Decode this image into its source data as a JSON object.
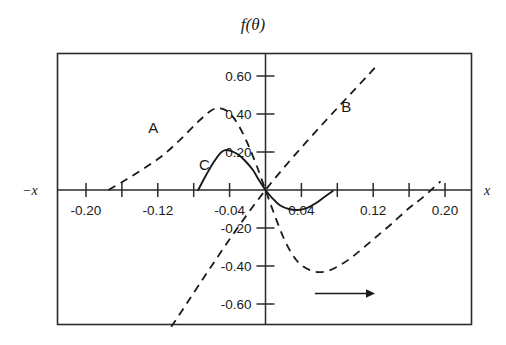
{
  "chart_data": {
    "type": "line",
    "title": "f(θ)",
    "xlabel_right": "x",
    "xlabel_left": "−x",
    "ylabel": "f(θ)",
    "grid": false,
    "legend_position": "inline-annotations",
    "xlim": [
      -0.24,
      0.24
    ],
    "ylim": [
      -0.78,
      0.78
    ],
    "xticks": [
      -0.2,
      -0.16,
      -0.12,
      -0.08,
      -0.04,
      0.04,
      0.08,
      0.12,
      0.16,
      0.2
    ],
    "xtick_labels": [
      "-0.20",
      "-0.12",
      "-0.04",
      "0.04",
      "0.12",
      "0.20"
    ],
    "xtick_labeled_values": [
      -0.2,
      -0.12,
      -0.04,
      0.04,
      0.12,
      0.2
    ],
    "yticks": [
      0.6,
      0.4,
      0.2,
      -0.2,
      -0.4,
      -0.6
    ],
    "ytick_labels": [
      "0.60",
      "0.40",
      "0.20",
      "-0.20",
      "-0.40",
      "-0.60"
    ],
    "annotations": [
      {
        "text": "A",
        "x": -0.125,
        "y": 0.3
      },
      {
        "text": "B",
        "x": 0.09,
        "y": 0.41
      },
      {
        "text": "C",
        "x": -0.068,
        "y": 0.105
      },
      {
        "text": "arrow",
        "x1": 0.055,
        "y1": -0.545,
        "x2": 0.122,
        "y2": -0.545
      }
    ],
    "series": [
      {
        "name": "A",
        "style": "dashed",
        "description": "dispersive lineshape: rises from zero near x=-0.17, peaks +0.43 near x=-0.055, crosses zero at origin, minimum -0.43 near x=+0.065, returns toward zero near x=+0.175",
        "x": [
          -0.175,
          -0.155,
          -0.135,
          -0.115,
          -0.095,
          -0.075,
          -0.06,
          -0.05,
          -0.04,
          -0.03,
          -0.02,
          -0.01,
          0.0,
          0.01,
          0.02,
          0.03,
          0.04,
          0.055,
          0.07,
          0.085,
          0.1,
          0.12,
          0.14,
          0.16,
          0.175,
          0.195
        ],
        "y": [
          0.0,
          0.055,
          0.115,
          0.18,
          0.265,
          0.36,
          0.42,
          0.43,
          0.405,
          0.34,
          0.245,
          0.13,
          0.0,
          -0.13,
          -0.25,
          -0.34,
          -0.395,
          -0.43,
          -0.425,
          -0.39,
          -0.34,
          -0.26,
          -0.18,
          -0.095,
          -0.04,
          0.045
        ]
      },
      {
        "name": "B",
        "style": "dashed",
        "description": "straight line through the origin with positive slope, from lower-left to upper-right",
        "x": [
          -0.105,
          0.0,
          0.125
        ],
        "y": [
          -0.72,
          0.0,
          0.66
        ]
      },
      {
        "name": "C",
        "style": "solid",
        "description": "small S-shaped absorptive curve: zero near x=-0.073, maximum +0.21 at x=-0.045, zero at origin, minimum -0.105 near x=+0.040, back to zero near x=+0.075",
        "x": [
          -0.075,
          -0.066,
          -0.058,
          -0.05,
          -0.045,
          -0.038,
          -0.03,
          -0.022,
          -0.014,
          -0.007,
          0.0,
          0.008,
          0.016,
          0.026,
          0.036,
          0.046,
          0.056,
          0.066,
          0.075
        ],
        "y": [
          0.0,
          0.08,
          0.145,
          0.195,
          0.21,
          0.205,
          0.185,
          0.15,
          0.105,
          0.05,
          0.0,
          -0.045,
          -0.08,
          -0.1,
          -0.105,
          -0.095,
          -0.07,
          -0.035,
          -0.005
        ]
      }
    ]
  },
  "figure": {
    "title": "f(θ)",
    "left_axis_label": "−x",
    "right_axis_label": "x",
    "labels": {
      "curve_a": "A",
      "curve_b": "B",
      "curve_c": "C"
    },
    "ytick_labels": [
      "0.60",
      "0.40",
      "0.20",
      "-0.20",
      "-0.40",
      "-0.60"
    ],
    "xtick_labels": [
      "-0.20",
      "-0.12",
      "-0.04",
      "0.04",
      "0.12",
      "0.20"
    ]
  }
}
